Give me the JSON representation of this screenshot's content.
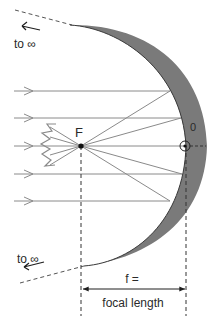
{
  "diagram": {
    "colors": {
      "mirror_fill": "#7a7a7a",
      "mirror_edge": "#3a3a3a",
      "ray": "#8a8a8a",
      "ink": "#1e1e1e",
      "background": "#ffffff"
    },
    "labels": {
      "focus": "F",
      "vertex": "0",
      "to_infinity_top": "to ∞",
      "to_infinity_bottom": "to ∞",
      "f_equals": "f =",
      "focal_length": "focal length"
    },
    "incoming_rays_y": [
      91,
      118,
      146,
      174,
      201
    ],
    "elements": [
      {
        "name": "concave-mirror",
        "description": "Parabolic concave mirror, shaded gray crescent"
      },
      {
        "name": "focal-point-F",
        "description": "Focal point on optical axis where reflected rays converge"
      },
      {
        "name": "vertex-0",
        "description": "Mirror vertex on optical axis, circled dot"
      },
      {
        "name": "optical-axis",
        "description": "Dashed horizontal axis through F and 0"
      },
      {
        "name": "parallel-incoming-rays",
        "count": 5
      },
      {
        "name": "reflected-rays-through-F",
        "description": "Rays reflected from mirror converge at F and diverge"
      },
      {
        "name": "focal-length-dimension",
        "description": "Double arrow from F to 0 labeled f = focal length"
      }
    ]
  }
}
